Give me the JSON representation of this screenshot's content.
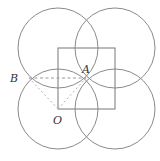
{
  "diagram": {
    "type": "geometry",
    "colors": {
      "circle_stroke": "#8a8a8a",
      "square_stroke": "#777777",
      "dashed_stroke": "#9a9a9a",
      "label": "#333333"
    },
    "square": {
      "x": 58,
      "y": 48,
      "width": 57,
      "height": 61
    },
    "circles": [
      {
        "name": "top-left",
        "cx": 58,
        "cy": 48,
        "r": 40
      },
      {
        "name": "top-right",
        "cx": 115,
        "cy": 48,
        "r": 40
      },
      {
        "name": "bottom-left",
        "cx": 58,
        "cy": 109,
        "r": 40
      },
      {
        "name": "bottom-right",
        "cx": 115,
        "cy": 109,
        "r": 40
      }
    ],
    "points": {
      "A": {
        "label": "A",
        "x": 86,
        "y": 78,
        "label_x": 82,
        "label_y": 73
      },
      "B": {
        "label": "B",
        "x": 29,
        "y": 78,
        "label_x": 10,
        "label_y": 82
      },
      "O": {
        "label": "O",
        "x": 58,
        "y": 109,
        "label_x": 53,
        "label_y": 124
      }
    },
    "segments": [
      {
        "from": "B",
        "to": "A",
        "style": "dashed"
      },
      {
        "from": "B",
        "to": "O",
        "style": "dotted"
      },
      {
        "from": "O",
        "to": "A",
        "style": "dotted"
      }
    ]
  }
}
